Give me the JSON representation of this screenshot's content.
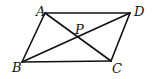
{
  "figure": {
    "type": "parallelogram-with-diagonals",
    "line_color": "#111111",
    "background": "#ffffff",
    "points": {
      "A": {
        "label": "A",
        "x": 45,
        "y": 13,
        "label_x": 36,
        "label_y": 16
      },
      "D": {
        "label": "D",
        "x": 130,
        "y": 13,
        "label_x": 134,
        "label_y": 16
      },
      "B": {
        "label": "B",
        "x": 22,
        "y": 62,
        "label_x": 12,
        "label_y": 72
      },
      "C": {
        "label": "C",
        "x": 111,
        "y": 61,
        "label_x": 112,
        "label_y": 73
      },
      "P": {
        "label": "P",
        "x": 78,
        "y": 38,
        "label_x": 75,
        "label_y": 34
      }
    },
    "segments": [
      {
        "name": "AD",
        "from": "A",
        "to": "D"
      },
      {
        "name": "AB",
        "from": "A",
        "to": "B"
      },
      {
        "name": "BC",
        "from": "B",
        "to": "C"
      },
      {
        "name": "CD",
        "from": "C",
        "to": "D"
      },
      {
        "name": "AC",
        "from": "A",
        "to": "C"
      },
      {
        "name": "BD",
        "from": "B",
        "to": "D"
      }
    ]
  }
}
